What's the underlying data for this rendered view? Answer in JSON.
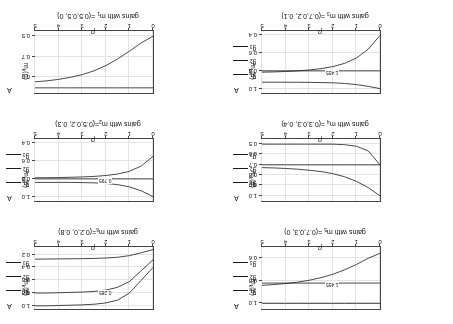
{
  "figure": {
    "orientation": "rotated-180",
    "xlabel": "p",
    "ylabel": "m",
    "ylabel_sub": "k",
    "ylabel_suffix": "(p)",
    "legend_title": "A",
    "legend": [
      {
        "label": "g",
        "sub": "1"
      },
      {
        "label": "g",
        "sub": "2"
      },
      {
        "label": "g",
        "sub": "3"
      }
    ]
  },
  "chart_data": [
    {
      "id": "panel-m5",
      "type": "line",
      "title": "gains with m",
      "title_sub": "5",
      "title_tail": " =(0.7,0.3, 0)",
      "xlabel": "p",
      "ylabel": "m_k(p)",
      "xlim": [
        0,
        5
      ],
      "ylim": [
        0.5,
        1.05
      ],
      "xticks": [
        0,
        1,
        2,
        3,
        4,
        5
      ],
      "xticklabels": [
        "0",
        "1",
        "2",
        "3",
        "4",
        "5"
      ],
      "yticks": [
        0.6,
        0.8,
        1.0
      ],
      "yticklabels": [
        "0.6",
        "0.8",
        "1.0"
      ],
      "grid": true,
      "annotation": "1.455",
      "series": [
        {
          "name": "g1",
          "x": [
            0,
            0.5,
            1,
            1.5,
            2,
            2.5,
            3,
            3.5,
            4,
            4.5,
            5
          ],
          "values": [
            1.0,
            1.0,
            1.0,
            1.0,
            1.0,
            1.0,
            1.0,
            1.0,
            1.0,
            1.0,
            1.0
          ]
        },
        {
          "name": "g2",
          "x": [
            0,
            0.5,
            1,
            1.5,
            2,
            2.5,
            3,
            3.5,
            4,
            4.5,
            5
          ],
          "values": [
            0.82,
            0.82,
            0.82,
            0.82,
            0.82,
            0.82,
            0.82,
            0.82,
            0.82,
            0.82,
            0.82
          ]
        },
        {
          "name": "g3",
          "x": [
            0,
            0.5,
            1,
            1.5,
            2,
            2.5,
            3,
            3.5,
            4,
            4.5,
            5
          ],
          "values": [
            0.556,
            0.6,
            0.655,
            0.702,
            0.742,
            0.772,
            0.795,
            0.812,
            0.824,
            0.833,
            0.84
          ]
        }
      ]
    },
    {
      "id": "panel-m6",
      "type": "line",
      "title": "gains with m",
      "title_sub": "6",
      "title_tail": "=(0.2,0, 0.8)",
      "xlabel": "p",
      "ylabel": "m_k(p)",
      "xlim": [
        0,
        5
      ],
      "ylim": [
        0.08,
        1.05
      ],
      "xticks": [
        0,
        1,
        2,
        3,
        4,
        5
      ],
      "xticklabels": [
        "0",
        "1",
        "2",
        "3",
        "4",
        "5"
      ],
      "yticks": [
        0.2,
        0.4,
        0.6,
        0.8,
        1.0
      ],
      "yticklabels": [
        "0.2",
        "0.4",
        "0.6",
        "0.8",
        "1.0"
      ],
      "grid": true,
      "annotation": "0.285",
      "series": [
        {
          "name": "g1",
          "x": [
            0,
            0.5,
            1,
            1.5,
            2,
            2.5,
            3,
            3.5,
            4,
            4.5,
            5
          ],
          "values": [
            0.4,
            0.6,
            0.8,
            0.91,
            0.955,
            0.975,
            0.985,
            0.99,
            0.995,
            1.0,
            1.0
          ]
        },
        {
          "name": "g2",
          "x": [
            0,
            0.5,
            1,
            1.5,
            2,
            2.5,
            3,
            3.5,
            4,
            4.5,
            5
          ],
          "values": [
            0.28,
            0.45,
            0.62,
            0.71,
            0.755,
            0.775,
            0.785,
            0.79,
            0.795,
            0.8,
            0.8
          ]
        },
        {
          "name": "g3",
          "x": [
            0,
            0.5,
            1,
            1.5,
            2,
            2.5,
            3,
            3.5,
            4,
            4.5,
            5
          ],
          "values": [
            0.12,
            0.17,
            0.215,
            0.24,
            0.252,
            0.258,
            0.262,
            0.264,
            0.266,
            0.268,
            0.27
          ]
        }
      ]
    },
    {
      "id": "panel-m4",
      "type": "line",
      "title": "gains with m",
      "title_sub": "4",
      "title_tail": " =(0.3,0.3, 0.4)",
      "xlabel": "p",
      "ylabel": "m_k(p)",
      "xlim": [
        0,
        5
      ],
      "ylim": [
        0.45,
        1.05
      ],
      "xticks": [
        0,
        1,
        2,
        3,
        4,
        5
      ],
      "xticklabels": [
        "0",
        "1",
        "2",
        "3",
        "4",
        "5"
      ],
      "yticks": [
        0.5,
        0.6,
        0.7,
        0.8,
        0.9,
        1.0
      ],
      "yticklabels": [
        "0.5",
        "0.6",
        "0.7",
        "0.8",
        "0.9",
        "1.0"
      ],
      "grid": true,
      "annotation": "",
      "series": [
        {
          "name": "g1",
          "x": [
            0,
            0.5,
            1,
            1.5,
            2,
            2.5,
            3,
            3.5,
            4,
            4.5,
            5
          ],
          "values": [
            1.0,
            0.92,
            0.86,
            0.815,
            0.785,
            0.765,
            0.752,
            0.742,
            0.735,
            0.73,
            0.727
          ]
        },
        {
          "name": "g2",
          "x": [
            0,
            0.5,
            1,
            1.5,
            2,
            2.5,
            3,
            3.5,
            4,
            4.5,
            5
          ],
          "values": [
            0.7,
            0.7,
            0.7,
            0.7,
            0.7,
            0.7,
            0.7,
            0.7,
            0.7,
            0.7,
            0.7
          ]
        },
        {
          "name": "g3",
          "x": [
            0,
            0.5,
            1,
            1.5,
            2,
            2.5,
            3,
            3.5,
            4,
            4.5,
            5
          ],
          "values": [
            0.7,
            0.565,
            0.52,
            0.505,
            0.5,
            0.5,
            0.5,
            0.5,
            0.5,
            0.5,
            0.5
          ]
        }
      ]
    },
    {
      "id": "panel-m2",
      "type": "line",
      "title": "gains with m",
      "title_sub": "2",
      "title_tail": "=(0.5,0.2, 0.3)",
      "xlabel": "p",
      "ylabel": "m_k(p)",
      "xlim": [
        0,
        5
      ],
      "ylim": [
        0.35,
        1.05
      ],
      "xticks": [
        0,
        1,
        2,
        3,
        4,
        5
      ],
      "xticklabels": [
        "0",
        "1",
        "2",
        "3",
        "4",
        "5"
      ],
      "yticks": [
        0.4,
        0.6,
        0.8,
        1.0
      ],
      "yticklabels": [
        "0.4",
        "0.6",
        "0.8",
        "1.0"
      ],
      "grid": true,
      "annotation": "0.795",
      "series": [
        {
          "name": "g1",
          "x": [
            0,
            0.5,
            1,
            1.5,
            2,
            2.5,
            3,
            3.5,
            4,
            4.5,
            5
          ],
          "values": [
            1.0,
            0.935,
            0.89,
            0.865,
            0.852,
            0.845,
            0.842,
            0.84,
            0.84,
            0.84,
            0.84
          ]
        },
        {
          "name": "g2",
          "x": [
            0,
            0.5,
            1,
            1.5,
            2,
            2.5,
            3,
            3.5,
            4,
            4.5,
            5
          ],
          "values": [
            0.8,
            0.8,
            0.8,
            0.8,
            0.8,
            0.8,
            0.8,
            0.8,
            0.8,
            0.8,
            0.8
          ]
        },
        {
          "name": "g3",
          "x": [
            0,
            0.5,
            1,
            1.5,
            2,
            2.5,
            3,
            3.5,
            4,
            4.5,
            5
          ],
          "values": [
            0.545,
            0.655,
            0.715,
            0.745,
            0.762,
            0.772,
            0.778,
            0.782,
            0.785,
            0.787,
            0.788
          ]
        }
      ]
    },
    {
      "id": "panel-m3",
      "type": "line",
      "title": "gains with m",
      "title_sub": "3",
      "title_tail": " =(0.7,0.2, 0.1)",
      "xlabel": "p",
      "ylabel": "m_k(p)",
      "xlim": [
        0,
        5
      ],
      "ylim": [
        0.35,
        1.05
      ],
      "xticks": [
        0,
        1,
        2,
        3,
        4,
        5
      ],
      "xticklabels": [
        "0",
        "1",
        "2",
        "3",
        "4",
        "5"
      ],
      "yticks": [
        0.4,
        0.6,
        0.8,
        1.0
      ],
      "yticklabels": [
        "0.4",
        "0.6",
        "0.8",
        "1.0"
      ],
      "grid": true,
      "annotation": "1.455",
      "series": [
        {
          "name": "g1",
          "x": [
            0,
            0.5,
            1,
            1.5,
            2,
            2.5,
            3,
            3.5,
            4,
            4.5,
            5
          ],
          "values": [
            1.0,
            0.975,
            0.955,
            0.942,
            0.935,
            0.932,
            0.93,
            0.929,
            0.928,
            0.928,
            0.928
          ]
        },
        {
          "name": "g2",
          "x": [
            0,
            0.5,
            1,
            1.5,
            2,
            2.5,
            3,
            3.5,
            4,
            4.5,
            5
          ],
          "values": [
            0.8,
            0.8,
            0.8,
            0.8,
            0.8,
            0.8,
            0.8,
            0.8,
            0.8,
            0.8,
            0.8
          ]
        },
        {
          "name": "g3",
          "x": [
            0,
            0.5,
            1,
            1.5,
            2,
            2.5,
            3,
            3.5,
            4,
            4.5,
            5
          ],
          "values": [
            0.4,
            0.555,
            0.655,
            0.715,
            0.752,
            0.775,
            0.79,
            0.8,
            0.807,
            0.812,
            0.815
          ]
        }
      ]
    },
    {
      "id": "panel-m1",
      "type": "line",
      "title": "gains with m",
      "title_sub": "1",
      "title_tail": " =(0.5,0.5, 0)",
      "xlabel": "p",
      "ylabel": "m_k(p)",
      "xlim": [
        0,
        5
      ],
      "ylim": [
        0.45,
        1.05
      ],
      "xticks": [
        0,
        1,
        2,
        3,
        4,
        5
      ],
      "xticklabels": [
        "0",
        "1",
        "2",
        "3",
        "4",
        "5"
      ],
      "yticks": [
        0.5,
        0.7,
        0.9
      ],
      "yticklabels": [
        "0.5",
        "0.7",
        "0.9"
      ],
      "grid": true,
      "annotation": "",
      "series": [
        {
          "name": "g1",
          "x": [
            0,
            0.5,
            1,
            1.5,
            2,
            2.5,
            3,
            3.5,
            4,
            4.5,
            5
          ],
          "values": [
            1.0,
            1.0,
            1.0,
            1.0,
            1.0,
            1.0,
            1.0,
            1.0,
            1.0,
            1.0,
            1.0
          ]
        },
        {
          "name": "g2",
          "x": [
            0,
            0.5,
            1,
            1.5,
            2,
            2.5,
            3,
            3.5,
            4,
            4.5,
            5
          ],
          "values": [
            0.5,
            0.565,
            0.645,
            0.72,
            0.785,
            0.835,
            0.872,
            0.898,
            0.918,
            0.932,
            0.942
          ]
        }
      ]
    }
  ]
}
